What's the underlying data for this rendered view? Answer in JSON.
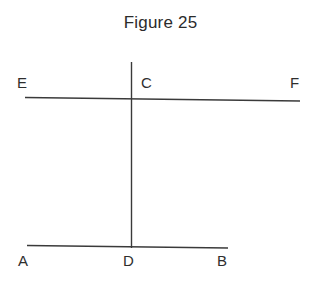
{
  "figure": {
    "title": "Figure 25",
    "background_color": "#ffffff",
    "line_color": "#3a3a3a",
    "text_color": "#2e2e2e"
  },
  "labels": {
    "E": "E",
    "C": "C",
    "F": "F",
    "A": "A",
    "D": "D",
    "B": "B"
  },
  "chart_data": {
    "type": "diagram",
    "title": "Figure 25",
    "points": [
      {
        "name": "E",
        "x": 25,
        "y": 97,
        "label_x": 17,
        "label_y": 75
      },
      {
        "name": "C",
        "x": 131,
        "y": 99,
        "label_x": 141,
        "label_y": 75
      },
      {
        "name": "F",
        "x": 300,
        "y": 101,
        "label_x": 290,
        "label_y": 75
      },
      {
        "name": "A",
        "x": 27,
        "y": 245,
        "label_x": 18,
        "label_y": 253
      },
      {
        "name": "D",
        "x": 131,
        "y": 247,
        "label_x": 123,
        "label_y": 253
      },
      {
        "name": "B",
        "x": 228,
        "y": 248,
        "label_x": 217,
        "label_y": 253
      }
    ],
    "segments": [
      {
        "name": "line-EF",
        "from": "E",
        "to": "F",
        "x1": 25,
        "y1": 97,
        "x2": 300,
        "y2": 101
      },
      {
        "name": "line-AB",
        "from": "A",
        "to": "B",
        "x1": 27,
        "y1": 245,
        "x2": 228,
        "y2": 248
      },
      {
        "name": "line-CD",
        "from": "C",
        "to": "D",
        "x1": 131,
        "y1": 62,
        "x2": 131,
        "y2": 248
      }
    ],
    "xlim": [
      0,
      321
    ],
    "ylim": [
      286,
      0
    ],
    "grid": false,
    "legend": false
  }
}
